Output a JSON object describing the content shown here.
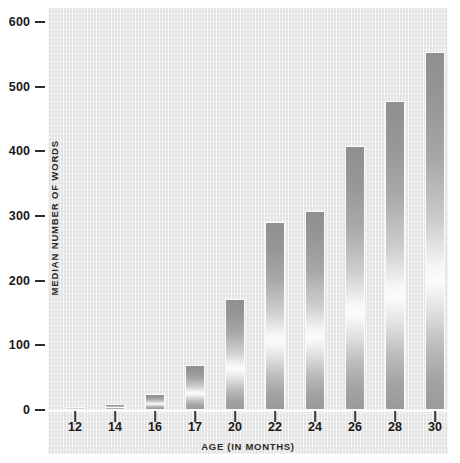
{
  "chart_data": {
    "type": "bar",
    "title": "",
    "xlabel": "AGE (IN MONTHS)",
    "ylabel": "MEDIAN NUMBER OF WORDS",
    "categories": [
      "12",
      "14",
      "16",
      "17",
      "20",
      "22",
      "24",
      "26",
      "28",
      "30"
    ],
    "values": [
      3,
      10,
      25,
      70,
      172,
      291,
      308,
      408,
      478,
      553
    ],
    "series": [
      {
        "name": "Median number of words",
        "values": [
          3,
          10,
          25,
          70,
          172,
          291,
          308,
          408,
          478,
          553
        ]
      }
    ],
    "ylim": [
      0,
      600
    ],
    "yticks": [
      0,
      100,
      200,
      300,
      400,
      500,
      600
    ],
    "ytick_labels": [
      "0",
      "100",
      "200",
      "300",
      "400",
      "500",
      "600"
    ],
    "grid": false,
    "legend": "none",
    "bar_fill": "#a8a8a8",
    "bar_edge": "#fafafa",
    "panel_color": "#e8e8e8",
    "text_color": "#1a1a1a"
  }
}
